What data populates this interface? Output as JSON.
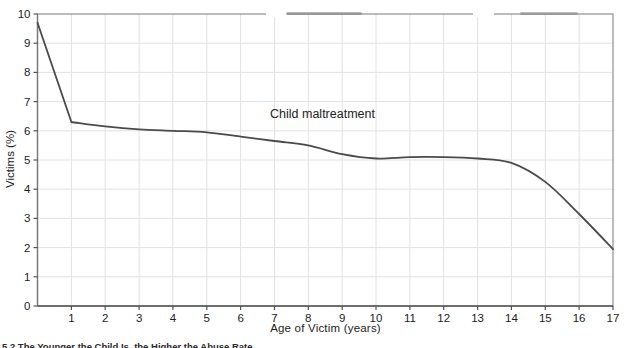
{
  "chart_data": {
    "type": "line",
    "title": "Child maltreatment",
    "xlabel": "Age of Victim (years)",
    "ylabel": "Victims (%)",
    "x": [
      0,
      1,
      2,
      3,
      4,
      5,
      6,
      7,
      8,
      9,
      10,
      11,
      12,
      13,
      14,
      15,
      16,
      17
    ],
    "series": [
      {
        "name": "Child maltreatment",
        "values": [
          9.7,
          6.3,
          6.15,
          6.05,
          6.0,
          5.95,
          5.8,
          5.65,
          5.5,
          5.2,
          5.05,
          5.1,
          5.1,
          5.05,
          4.9,
          4.25,
          3.15,
          1.95
        ]
      }
    ],
    "xlim": [
      0,
      17
    ],
    "ylim": [
      0,
      10
    ],
    "x_ticks": [
      1,
      2,
      3,
      4,
      5,
      6,
      7,
      8,
      9,
      10,
      11,
      12,
      13,
      14,
      15,
      16,
      17
    ],
    "y_ticks": [
      0,
      1,
      2,
      3,
      4,
      5,
      6,
      7,
      8,
      9,
      10
    ],
    "grid": true,
    "legend": "none",
    "annotation": {
      "text": "Child maltreatment",
      "x": 8.42,
      "y": 6.44
    },
    "colors": {
      "line": "#4a4a4a",
      "grid": "#e2e2e2",
      "border": "#8f8f8f",
      "axis": "#555555",
      "text": "#1c1c1c"
    }
  },
  "caption": {
    "text": "5.2   The Younger the Child Is, the Higher the Abuse Rate"
  }
}
